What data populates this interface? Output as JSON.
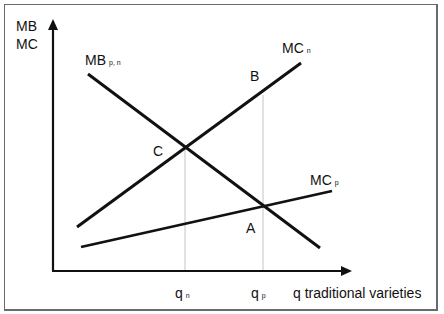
{
  "axes": {
    "y_label_line1": "MB",
    "y_label_line2": "MC",
    "x_label": "q traditional varieties"
  },
  "curves": {
    "mb": {
      "main": "MB",
      "sub": "p, n"
    },
    "mc_n": {
      "main": "MC",
      "sub": "n"
    },
    "mc_p": {
      "main": "MC",
      "sub": "p"
    }
  },
  "points": {
    "a": "A",
    "b": "B",
    "c": "C"
  },
  "ticks": {
    "qn": {
      "main": "q",
      "sub": "n"
    },
    "qp": {
      "main": "q",
      "sub": "p"
    }
  },
  "colors": {
    "line": "#111111",
    "guide": "#bdbdbd",
    "frame": "#6a6a6a"
  }
}
